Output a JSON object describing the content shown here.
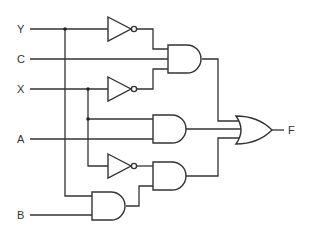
{
  "diagram": {
    "type": "logic-circuit",
    "inputs": [
      {
        "id": "Y",
        "label": "Y"
      },
      {
        "id": "C",
        "label": "C"
      },
      {
        "id": "X",
        "label": "X"
      },
      {
        "id": "A",
        "label": "A"
      },
      {
        "id": "B",
        "label": "B"
      }
    ],
    "output": {
      "id": "F",
      "label": "F"
    },
    "gates": [
      {
        "id": "not1",
        "type": "NOT",
        "inputs": [
          "Y"
        ]
      },
      {
        "id": "and1",
        "type": "AND",
        "inputs": [
          "not1",
          "C",
          "not2"
        ]
      },
      {
        "id": "not2",
        "type": "NOT",
        "inputs": [
          "X"
        ]
      },
      {
        "id": "and2",
        "type": "AND",
        "inputs": [
          "X",
          "A"
        ]
      },
      {
        "id": "not3",
        "type": "NOT",
        "inputs": [
          "X"
        ]
      },
      {
        "id": "and3",
        "type": "AND",
        "inputs": [
          "not3",
          "and4"
        ]
      },
      {
        "id": "and4",
        "type": "AND",
        "inputs": [
          "Y",
          "B"
        ]
      },
      {
        "id": "or1",
        "type": "OR",
        "inputs": [
          "and1",
          "and2",
          "and3"
        ],
        "output": "F"
      }
    ]
  }
}
